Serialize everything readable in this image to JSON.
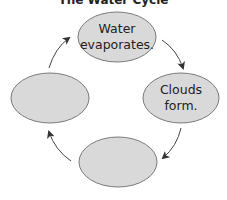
{
  "title": "The Water Cycle",
  "colors": {
    "node_fill": "#d9d9d9",
    "node_stroke": "#7a7a7a",
    "arrow": "#333333",
    "text": "#222222"
  },
  "nodes": [
    {
      "id": "top",
      "lines": [
        "Water",
        "evaporates."
      ],
      "cx": 117,
      "cy": 37,
      "rx": 39,
      "ry": 25
    },
    {
      "id": "right",
      "lines": [
        "Clouds",
        "form."
      ],
      "cx": 181,
      "cy": 98,
      "rx": 38,
      "ry": 25
    },
    {
      "id": "bottom",
      "lines": [],
      "cx": 118,
      "cy": 162,
      "rx": 39,
      "ry": 25
    },
    {
      "id": "left",
      "lines": [],
      "cx": 50,
      "cy": 98,
      "rx": 39,
      "ry": 25
    }
  ],
  "arrows": [
    {
      "from": "top",
      "to": "right",
      "direction": "clockwise"
    },
    {
      "from": "right",
      "to": "bottom",
      "direction": "clockwise"
    },
    {
      "from": "bottom",
      "to": "left",
      "direction": "clockwise"
    },
    {
      "from": "left",
      "to": "top",
      "direction": "clockwise"
    }
  ]
}
